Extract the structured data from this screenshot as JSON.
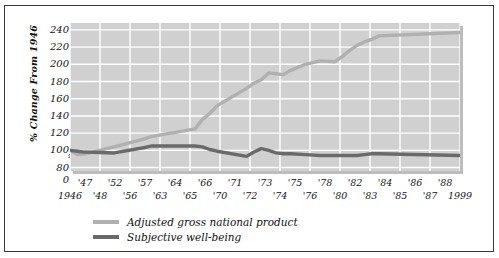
{
  "chart_data": {
    "type": "line",
    "title": "",
    "xlabel": "",
    "ylabel": "% Change From 1946",
    "ylim": [
      76,
      248
    ],
    "ytick_values": [
      240,
      220,
      200,
      180,
      160,
      140,
      120,
      100,
      80,
      0
    ],
    "y_axis_break": true,
    "grid": true,
    "legend_position": "below-left",
    "x_row_top": [
      "'47",
      "'52",
      "'57",
      "'64",
      "'66",
      "'71",
      "'73",
      "'75",
      "'78",
      "'82",
      "'84",
      "'86",
      "'88"
    ],
    "x_row_bottom": [
      "1946",
      "'48",
      "'56",
      "'63",
      "'65",
      "'70",
      "'72",
      "'74",
      "'76",
      "'80",
      "'83",
      "'85",
      "'87",
      "1999"
    ],
    "x": [
      1946,
      1947,
      1948,
      1952,
      1956,
      1957,
      1963,
      1964,
      1965,
      1966,
      1970,
      1971,
      1972,
      1973,
      1974,
      1975,
      1976,
      1978,
      1980,
      1982,
      1983,
      1984,
      1985,
      1986,
      1987,
      1988,
      1999
    ],
    "series": [
      {
        "name": "Adjusted gross national product",
        "color": "#b0b0b0",
        "values": [
          100,
          95,
          96,
          104,
          113,
          116,
          125,
          136,
          143,
          152,
          172,
          178,
          182,
          190,
          189,
          188,
          193,
          200,
          204,
          203,
          209,
          216,
          222,
          226,
          229,
          233,
          237
        ]
      },
      {
        "name": "Subjective well-being",
        "color": "#6a6a6a",
        "values": [
          100,
          99,
          98,
          97,
          103,
          105,
          105,
          104,
          101,
          99,
          93,
          98,
          102,
          100,
          97,
          96,
          96,
          95,
          94,
          94,
          94,
          94,
          94,
          95,
          96,
          96,
          94
        ]
      }
    ]
  },
  "legend": {
    "items": [
      {
        "label": "Adjusted gross national product",
        "color": "#b0b0b0"
      },
      {
        "label": "Subjective well-being",
        "color": "#6a6a6a"
      }
    ]
  },
  "axis": {
    "y_title": "% Change From 1946",
    "break_glyph": "≈"
  }
}
